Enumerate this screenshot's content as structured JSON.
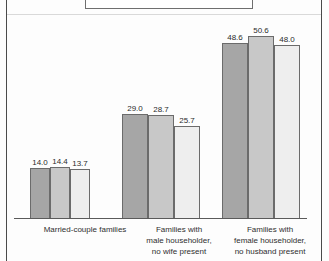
{
  "figure": {
    "background_color": "#fdfdfd",
    "frame_color": "#4a4a4a",
    "legend_box_visible_partial": true
  },
  "chart_data": {
    "type": "bar",
    "title": "",
    "subtitle": "",
    "xlabel": "",
    "ylabel": "",
    "ylim": [
      0,
      56
    ],
    "grid": false,
    "legend_position": "top",
    "categories": [
      "Married-couple families",
      "Families with\nmale householder,\nno wife present",
      "Families with\nfemale householder,\nno husband present"
    ],
    "series": [
      {
        "name": "series-1",
        "color": "#a6a6a6",
        "values": [
          14.0,
          28.999999999999996,
          48.6
        ]
      },
      {
        "name": "series-2",
        "color": "#c8c8c8",
        "values": [
          14.4,
          28.7,
          50.6
        ]
      },
      {
        "name": "series-3",
        "color": "#eeeeee",
        "values": [
          13.7,
          25.7,
          48.0
        ]
      }
    ],
    "data_labels": [
      [
        "14.0",
        "14.4",
        "13.7"
      ],
      [
        "29.0",
        "28.7",
        "25.7"
      ],
      [
        "48.6",
        "50.6",
        "48.0"
      ]
    ]
  }
}
